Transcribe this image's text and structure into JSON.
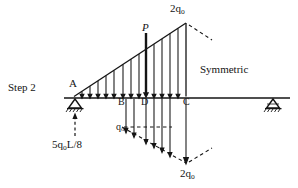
{
  "figure": {
    "title_label": "Step 2",
    "symmetry_note": "Symmetric",
    "background_color": "#ffffff",
    "ink_color": "#141414"
  },
  "nodes": [
    {
      "id": "A",
      "label": "A",
      "x": 74,
      "y": 98,
      "role": "left-support-node"
    },
    {
      "id": "B",
      "label": "B",
      "x": 123,
      "y": 98,
      "role": "beam-node"
    },
    {
      "id": "D",
      "label": "D",
      "x": 146,
      "y": 98,
      "role": "load-point-node"
    },
    {
      "id": "C",
      "label": "C",
      "x": 186,
      "y": 98,
      "role": "beam-node"
    }
  ],
  "supports": [
    {
      "name": "pin-support-left",
      "x": 75,
      "y": 99,
      "type": "pinned-hatched-triangle"
    },
    {
      "name": "pin-support-right",
      "x": 273,
      "y": 99,
      "type": "pinned-hatched-triangle"
    }
  ],
  "beam": {
    "x_start": 64,
    "x_end": 290,
    "y": 98
  },
  "loads": {
    "point_load": {
      "label": "P",
      "applied_at_node": "D",
      "direction": "downward"
    },
    "distributed_top": {
      "peak_label": "2q",
      "peak_subscript": "o",
      "shape": "triangular",
      "from_node": "A",
      "to_node": "C",
      "arrow_count": 13
    },
    "distributed_bottom": {
      "mid_label": "q",
      "mid_subscript": "o",
      "peak_label": "2q",
      "peak_subscript": "o",
      "shape": "triangular",
      "direction": "downward"
    }
  },
  "reaction": {
    "label_prefix": "5q",
    "label_subscript": "o",
    "label_suffix": "L/8",
    "direction": "upward",
    "at_node": "A"
  }
}
